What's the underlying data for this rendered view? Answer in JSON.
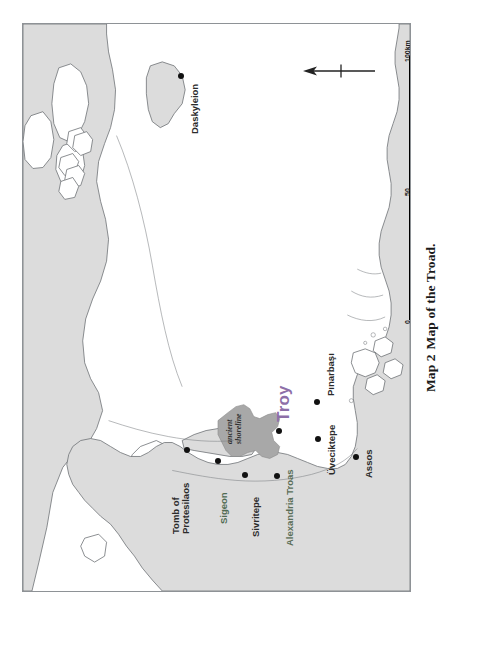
{
  "caption": {
    "number": "Map 2",
    "text": "Map of the Troad."
  },
  "map": {
    "title": "Map of the Troad",
    "orientation": "rotated-90-ccw",
    "colors": {
      "land": "#dcdcdc",
      "sea": "#ffffff",
      "coastline": "#6e7276",
      "ancient_bay_fill": "#a8a8a8",
      "troy_label": "#8d6fa8",
      "sigeon_label": "#4f6b52",
      "frame": "#8e9296"
    },
    "places": [
      {
        "name": "Daskyleion",
        "dot": true,
        "label_color": "#2b2b2b"
      },
      {
        "name": "Tomb of Protesilaos",
        "dot": true,
        "label_color": "#2b2b2b",
        "lines": [
          "Tomb of",
          "Protesilaos"
        ]
      },
      {
        "name": "Sigeon",
        "dot": true,
        "label_color": "#4f6b52"
      },
      {
        "name": "Sivritepe",
        "dot": true,
        "label_color": "#2b2b2b"
      },
      {
        "name": "Troy",
        "dot": true,
        "label_color": "#8d6fa8"
      },
      {
        "name": "Pınarbaşı",
        "dot": true,
        "label_color": "#2b2b2b"
      },
      {
        "name": "Üveciktepe",
        "dot": true,
        "label_color": "#2b2b2b"
      },
      {
        "name": "Alexandria Troas",
        "dot": true,
        "label_color": "#5a6e58"
      },
      {
        "name": "Assos",
        "dot": true,
        "label_color": "#2b2b2b"
      }
    ],
    "annotations": [
      {
        "name": "ancient-shoreline",
        "lines": [
          "ancient",
          "shoreline"
        ],
        "style": "italic"
      }
    ],
    "north_arrow": {
      "label": "",
      "direction": "north"
    },
    "scalebar": {
      "unit": "km",
      "ticks": [
        {
          "value": "0",
          "position": "bottom"
        },
        {
          "value": "50",
          "position": "middle"
        },
        {
          "value": "100km",
          "position": "top"
        }
      ]
    }
  }
}
